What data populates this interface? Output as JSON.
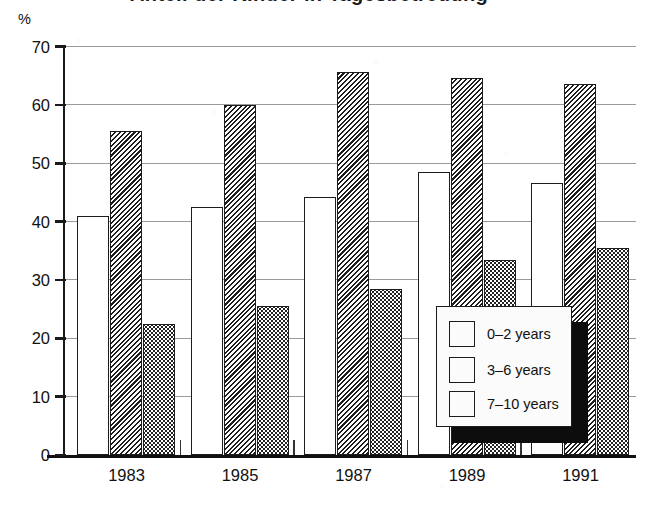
{
  "title": {
    "text": "Anteil der Kinder in Tagesbetreuung"
  },
  "axis": {
    "y_unit": "%",
    "y_ticks": [
      70,
      60,
      50,
      40,
      30,
      20,
      10,
      0
    ],
    "x_ticks": [
      "1983",
      "1985",
      "1987",
      "1989",
      "1991"
    ]
  },
  "legend": {
    "items": [
      {
        "label": "0–2 years",
        "pattern": "white",
        "swatch_name": "legend-swatch-white"
      },
      {
        "label": "3–6 years",
        "pattern": "hatch",
        "swatch_name": "legend-swatch-hatched"
      },
      {
        "label": "7–10 years",
        "pattern": "dots",
        "swatch_name": "legend-swatch-dotted"
      }
    ]
  },
  "chart_data": {
    "type": "bar",
    "title": "Anteil der Kinder in Tagesbetreuung",
    "xlabel": "",
    "ylabel": "%",
    "ylim": [
      0,
      70
    ],
    "ytick_step": 10,
    "grid": true,
    "legend_position": "inside-bottom-right",
    "categories": [
      "1983",
      "1985",
      "1987",
      "1989",
      "1991"
    ],
    "series": [
      {
        "name": "0–2 years",
        "pattern": "white",
        "values": [
          41.0,
          42.5,
          44.3,
          48.5,
          46.6
        ]
      },
      {
        "name": "3–6 years",
        "pattern": "hatched",
        "values": [
          55.5,
          60.0,
          65.6,
          64.6,
          63.6
        ]
      },
      {
        "name": "7–10 years",
        "pattern": "dotted",
        "values": [
          22.5,
          25.5,
          28.4,
          33.5,
          35.5
        ]
      }
    ]
  },
  "colors": {
    "ink": "#111111",
    "gridline": "#9a9a9a",
    "legend_bg": "#fbfbfb",
    "shadow": "#0d0d0d"
  }
}
